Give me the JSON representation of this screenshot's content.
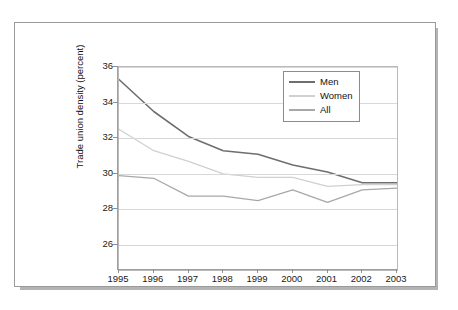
{
  "chart_data": {
    "type": "line",
    "title": "",
    "xlabel": "",
    "ylabel": "Trade union density (percent)",
    "x": [
      1995,
      1996,
      1997,
      1998,
      1999,
      2000,
      2001,
      2002,
      2003
    ],
    "xticklabels": [
      "1995",
      "1996",
      "1997",
      "1998",
      "1999",
      "2000",
      "2001",
      "2002",
      "2003"
    ],
    "yticklabels": [
      "26",
      "28",
      "30",
      "32",
      "34",
      "36"
    ],
    "yticks": [
      26,
      28,
      30,
      32,
      34,
      36
    ],
    "ylim": [
      24.6,
      36.0
    ],
    "xlim": [
      1995,
      2003
    ],
    "grid": "horizontal",
    "legend_position": "top-right",
    "series": [
      {
        "name": "Men",
        "color": "#6e6e6e",
        "values": [
          35.3,
          33.5,
          32.1,
          31.3,
          31.1,
          30.5,
          30.1,
          29.5,
          29.5
        ]
      },
      {
        "name": "Women",
        "color": "#d0d0d0",
        "values": [
          32.5,
          31.3,
          30.7,
          30.0,
          29.8,
          29.8,
          29.3,
          29.4,
          29.4
        ]
      },
      {
        "name": "All",
        "color": "#a8a8a8",
        "values": [
          29.9,
          29.75,
          28.75,
          28.75,
          28.5,
          29.1,
          28.4,
          29.1,
          29.2
        ]
      }
    ]
  },
  "legend": {
    "items": [
      {
        "label": "Men"
      },
      {
        "label": "Women"
      },
      {
        "label": "All"
      }
    ]
  },
  "colors": {
    "men": "#6e6e6e",
    "women": "#d0d0d0",
    "all": "#a8a8a8",
    "grid": "#d8d8d8",
    "axis": "#9f9f9f",
    "card_border": "#9a9a9a",
    "shadow": "#b4b4b4",
    "background": "#ffffff"
  }
}
